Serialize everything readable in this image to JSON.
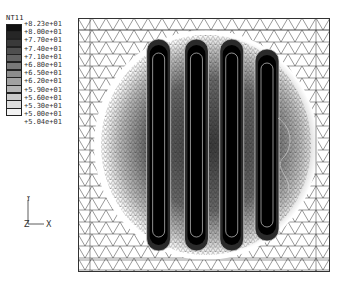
{
  "legend": {
    "title": "NT11",
    "values": [
      "+8.23e+01",
      "+8.00e+01",
      "+7.70e+01",
      "+7.40e+01",
      "+7.10e+01",
      "+6.80e+01",
      "+6.50e+01",
      "+6.20e+01",
      "+5.90e+01",
      "+5.60e+01",
      "+5.30e+01",
      "+5.00e+01",
      "+5.04e+01"
    ],
    "colors": [
      "#111111",
      "#262626",
      "#3a3a3a",
      "#4f4f4f",
      "#636363",
      "#787878",
      "#8c8c8c",
      "#a1a1a1",
      "#b5b5b5",
      "#cacaca",
      "#dedede",
      "#f3f3f3"
    ]
  },
  "triad": {
    "y_label": "Y",
    "z_label": "Z",
    "x_label": "X"
  },
  "plot": {
    "description": "Finite element mesh contour plot of temperature field NT11 with four vertical hot bands",
    "band_centers_x": [
      0.32,
      0.47,
      0.61,
      0.75
    ],
    "band_count": 4
  }
}
